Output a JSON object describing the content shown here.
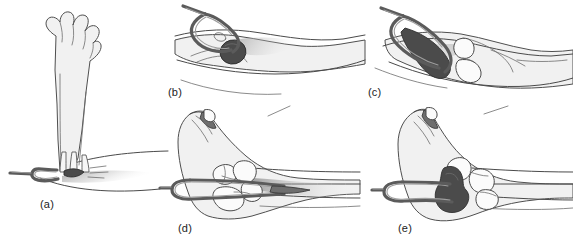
{
  "figure": {
    "background_color": "#ffffff",
    "panel_count": 5,
    "style": "line-art medical illustration, grayscale",
    "colors": {
      "background": "#ffffff",
      "outline": "#4a4a4a",
      "skin_fill": "#f1f1f1",
      "bone_fill": "#fbfbfb",
      "mass_dark": "#4b4b4b",
      "mass_mid": "#6e6e6e",
      "instrument": "#5b5b5b",
      "label_text": "#1c1c1c"
    },
    "panels": [
      {
        "id": "a",
        "label": "(a)",
        "label_x": 40,
        "label_y": 198,
        "view": "external lateral view of raised limb with wire loop placed at base",
        "contains": [
          "limb",
          "toes",
          "wire-loop-instrument",
          "skin-surface",
          "shadow"
        ]
      },
      {
        "id": "b",
        "label": "(b)",
        "label_x": 168,
        "label_y": 86,
        "view": "close-up external view, wire loop encircling a rounded dark mass",
        "contains": [
          "skin-fold",
          "wire-loop-instrument",
          "dark-round-mass"
        ]
      },
      {
        "id": "c",
        "label": "(c)",
        "label_x": 368,
        "label_y": 86,
        "view": "close-up external view, dark mass drawn out and elongated by the loop",
        "contains": [
          "skin-fold",
          "wire-loop-instrument",
          "elongated-dark-mass",
          "pale-nodule"
        ]
      },
      {
        "id": "d",
        "label": "(d)",
        "label_x": 178,
        "label_y": 222,
        "view": "sagittal cross-section of foot showing bones and instrument in position",
        "contains": [
          "foot-outline",
          "bone-segments",
          "wire-loop-instrument",
          "tendon-lines"
        ]
      },
      {
        "id": "e",
        "label": "(e)",
        "label_x": 398,
        "label_y": 222,
        "view": "sagittal cross-section of foot with dark mass captured inside the loop",
        "contains": [
          "foot-outline",
          "bone-segments",
          "wire-loop-instrument",
          "dark-mass",
          "tendon-lines"
        ]
      }
    ]
  }
}
